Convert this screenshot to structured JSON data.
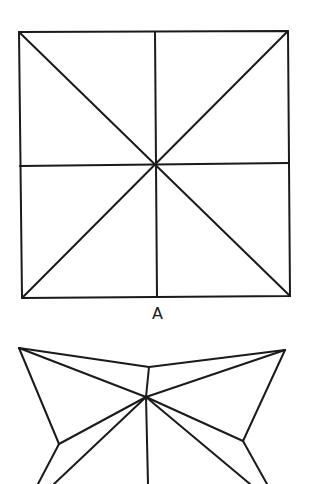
{
  "figure_a": {
    "label": "A",
    "description": "Square with vertical, horizontal, and both diagonal creases meeting at center",
    "square": {
      "top_left": [
        19,
        32
      ],
      "top_right": [
        288,
        31
      ],
      "bottom_right": [
        290,
        296
      ],
      "bottom_left": [
        22,
        298
      ]
    },
    "center": [
      156,
      165
    ],
    "mid_top": [
      155,
      32
    ],
    "mid_bottom": [
      157,
      297
    ],
    "mid_left": [
      20,
      166
    ],
    "mid_right": [
      289,
      163
    ]
  },
  "figure_b": {
    "description": "Partially folded form (truncated at bottom edge)",
    "left_tip": [
      19,
      348
    ],
    "right_tip": [
      285,
      350
    ],
    "top_ridge": [
      149,
      367
    ],
    "center_vertex": [
      146,
      397
    ],
    "left_elbow": [
      59,
      444
    ],
    "right_elbow": [
      243,
      441
    ],
    "bottom_left_outer": [
      38,
      484
    ],
    "bottom_left_inner": [
      54,
      484
    ],
    "bottom_center": [
      148,
      484
    ],
    "bottom_right_inner": [
      250,
      484
    ],
    "bottom_right_outer": [
      267,
      484
    ]
  },
  "colors": {
    "stroke": "#1a1a1a",
    "background": "#ffffff"
  }
}
